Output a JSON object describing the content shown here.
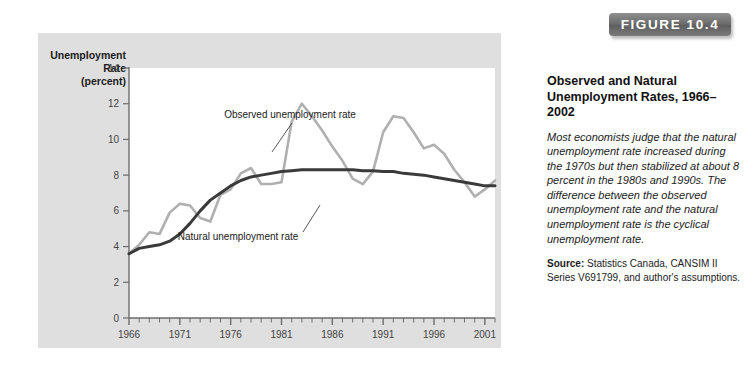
{
  "figure": {
    "badge_label": "FIGURE 10.4",
    "panel_bg": "#dfdfdf",
    "plot_bg": "#ffffff"
  },
  "caption": {
    "title": "Observed and Natural Unemployment Rates, 1966–2002",
    "body": "Most economists judge that the natural unemployment rate increased during the 1970s but then stabilized at about 8 percent in the 1980s and 1990s. The difference between the observed unemployment rate and the natural unemployment rate is the cyclical unemployment rate.",
    "source_label": "Source:",
    "source_text": " Statistics Canada, CANSIM II Series V691799, and author's assumptions."
  },
  "chart_data": {
    "type": "line",
    "title": "Observed and Natural Unemployment Rates, 1966–2002",
    "xlabel": "",
    "ylabel": "Unemployment Rate (percent)",
    "ylabel_lines": [
      "Unemployment",
      "Rate",
      "(percent)"
    ],
    "xlim": [
      1966,
      2002
    ],
    "ylim": [
      0,
      14
    ],
    "yticks": [
      0,
      2,
      4,
      6,
      8,
      10,
      12,
      14
    ],
    "ytick_labels": [
      "0",
      "2",
      "4",
      "6",
      "8",
      "10",
      "12",
      "14"
    ],
    "xticks": [
      1966,
      1971,
      1976,
      1981,
      1986,
      1991,
      1996,
      2001
    ],
    "xtick_labels": [
      "1966",
      "1971",
      "1976",
      "1981",
      "1986",
      "1991",
      "1996",
      "2001"
    ],
    "x_minor_step": 1,
    "grid": false,
    "legend_position": "annotations",
    "x": [
      1966,
      1967,
      1968,
      1969,
      1970,
      1971,
      1972,
      1973,
      1974,
      1975,
      1976,
      1977,
      1978,
      1979,
      1980,
      1981,
      1982,
      1983,
      1984,
      1985,
      1986,
      1987,
      1988,
      1989,
      1990,
      1991,
      1992,
      1993,
      1994,
      1995,
      1996,
      1997,
      1998,
      1999,
      2000,
      2001,
      2002
    ],
    "series": [
      {
        "name": "Observed unemployment rate",
        "color": "#b0b0b0",
        "width": 2.6,
        "values": [
          3.6,
          4.1,
          4.8,
          4.7,
          5.9,
          6.4,
          6.3,
          5.6,
          5.4,
          6.9,
          7.2,
          8.1,
          8.4,
          7.5,
          7.5,
          7.6,
          11.0,
          12.0,
          11.3,
          10.5,
          9.6,
          8.8,
          7.8,
          7.5,
          8.2,
          10.4,
          11.3,
          11.2,
          10.4,
          9.5,
          9.7,
          9.2,
          8.3,
          7.6,
          6.8,
          7.2,
          7.7
        ]
      },
      {
        "name": "Natural unemployment rate",
        "color": "#3a3a3a",
        "width": 3.0,
        "values": [
          3.6,
          3.9,
          4.0,
          4.1,
          4.3,
          4.7,
          5.3,
          6.0,
          6.6,
          7.0,
          7.4,
          7.7,
          7.9,
          8.0,
          8.1,
          8.2,
          8.25,
          8.3,
          8.3,
          8.3,
          8.3,
          8.3,
          8.3,
          8.25,
          8.25,
          8.2,
          8.2,
          8.1,
          8.05,
          8.0,
          7.9,
          7.8,
          7.7,
          7.6,
          7.5,
          7.4,
          7.4
        ]
      }
    ],
    "annotations": [
      {
        "name": "observed-rate-annotation",
        "text": "Observed unemployment rate",
        "text_x": 290,
        "text_y": 118,
        "leader": {
          "x1": 292,
          "y1": 123,
          "x2": 272,
          "y2": 152
        }
      },
      {
        "name": "natural-rate-annotation",
        "text": "Natural unemployment rate",
        "text_x": 238,
        "text_y": 240,
        "leader": {
          "x1": 303,
          "y1": 232,
          "x2": 320,
          "y2": 205
        }
      }
    ]
  }
}
